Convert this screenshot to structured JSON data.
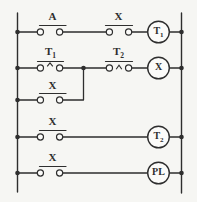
{
  "diagram": {
    "kind": "relay-ladder-logic-schematic",
    "rungs": [
      {
        "id": "rung-1",
        "contacts": [
          {
            "symbol": "no-contact",
            "base": "A",
            "sub": ""
          },
          {
            "symbol": "no-contact",
            "base": "X",
            "sub": ""
          }
        ],
        "coil": {
          "symbol": "relay-coil",
          "base": "T",
          "sub": "1"
        }
      },
      {
        "id": "rung-2",
        "contacts": [
          {
            "symbol": "timed-contact-raised-caret",
            "base": "T",
            "sub": "1"
          },
          {
            "symbol": "timed-contact-caret",
            "base": "T",
            "sub": "2"
          }
        ],
        "coil": {
          "symbol": "relay-coil",
          "base": "X",
          "sub": ""
        }
      },
      {
        "id": "rung-2-parallel-branch",
        "contacts": [
          {
            "symbol": "no-contact",
            "base": "X",
            "sub": ""
          }
        ]
      },
      {
        "id": "rung-3",
        "contacts": [
          {
            "symbol": "no-contact",
            "base": "X",
            "sub": ""
          }
        ],
        "coil": {
          "symbol": "relay-coil",
          "base": "T",
          "sub": "2"
        }
      },
      {
        "id": "rung-4",
        "contacts": [
          {
            "symbol": "no-contact",
            "base": "X",
            "sub": ""
          }
        ],
        "coil": {
          "symbol": "pilot-light-coil",
          "base": "PL",
          "sub": ""
        }
      }
    ]
  },
  "colors": {
    "ink": "#2e2e2e",
    "paper": "#f6f6f3",
    "symbol_fill": "#fbfbf9"
  }
}
